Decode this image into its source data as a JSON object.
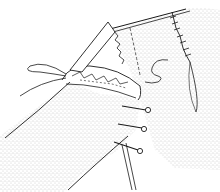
{
  "illustration": {
    "subject": "sewing-pinned-fabric-line-drawing",
    "colors": {
      "background": "#ffffff",
      "ink": "#1a1a1a",
      "stipple": "#8a8a8a"
    },
    "pins_count": 3,
    "elements": [
      "fabric-panel-back",
      "fabric-panel-front",
      "folded-edge-hem",
      "loose-thread",
      "cross-stitches",
      "pins"
    ]
  }
}
